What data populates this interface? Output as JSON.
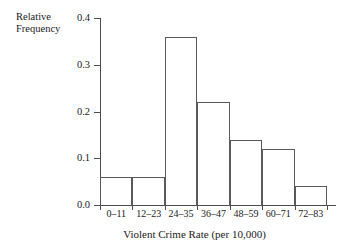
{
  "chart_data": {
    "type": "bar",
    "title": "",
    "subtitle": "",
    "xlabel": "Violent Crime Rate (per 10,000)",
    "ylabel": "Relative\nFrequency",
    "categories": [
      "0–11",
      "12–23",
      "24–35",
      "36–47",
      "48–59",
      "60–71",
      "72–83"
    ],
    "values": [
      0.06,
      0.06,
      0.36,
      0.22,
      0.14,
      0.12,
      0.04
    ],
    "ylim": [
      0.0,
      0.4
    ],
    "ytick_labels": [
      "0.0",
      "0.1",
      "0.2",
      "0.3",
      "0.4"
    ],
    "ytick_values": [
      0.0,
      0.1,
      0.2,
      0.3,
      0.4
    ],
    "grid": false,
    "legend": false,
    "legend_position": "none",
    "bar_fill_color": "#ffffff",
    "bar_edge_color": "#595959",
    "axis_color": "#4d4d4d",
    "text_color": "#1a1a1a",
    "background_color": "#ffffff",
    "annotations": []
  }
}
